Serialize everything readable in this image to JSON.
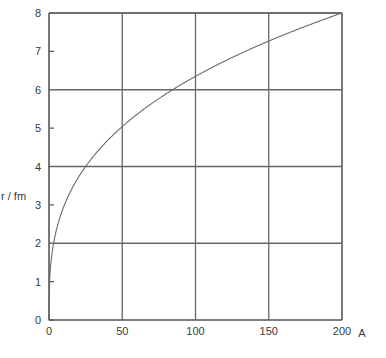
{
  "chart_data": {
    "type": "line",
    "title": "",
    "subtitle": "",
    "xlabel": "A",
    "ylabel": "r / fm",
    "xlim": [
      0,
      200
    ],
    "ylim": [
      0,
      8
    ],
    "grid": true,
    "grid_x_values": [
      50,
      100,
      150,
      200
    ],
    "grid_y_values": [
      2,
      4,
      6,
      8
    ],
    "legend": null,
    "legend_position": "none",
    "x_ticks": [
      {
        "value": 0,
        "label": "0",
        "gridline": false
      },
      {
        "value": 50,
        "label": "50",
        "gridline": true
      },
      {
        "value": 100,
        "label": "100",
        "gridline": true
      },
      {
        "value": 150,
        "label": "150",
        "gridline": true
      },
      {
        "value": 200,
        "label": "200",
        "gridline": true
      }
    ],
    "y_ticks": [
      {
        "value": 0,
        "label": "0",
        "gridline": false
      },
      {
        "value": 1,
        "label": "1",
        "gridline": false
      },
      {
        "value": 2,
        "label": "2",
        "gridline": true
      },
      {
        "value": 3,
        "label": "3",
        "gridline": false
      },
      {
        "value": 4,
        "label": "4",
        "gridline": true
      },
      {
        "value": 5,
        "label": "5",
        "gridline": false
      },
      {
        "value": 6,
        "label": "6",
        "gridline": true
      },
      {
        "value": 7,
        "label": "7",
        "gridline": false
      },
      {
        "value": 8,
        "label": "8",
        "gridline": true
      }
    ],
    "series": [
      {
        "name": "r = r0 * A^(1/3)",
        "color": "#6b6b6b",
        "r0": 1.368,
        "x": [
          0,
          0.5,
          1,
          2,
          3,
          4,
          5,
          6,
          8,
          10,
          12,
          15,
          18,
          20,
          25,
          30,
          35,
          40,
          45,
          50,
          60,
          70,
          80,
          90,
          100,
          110,
          120,
          130,
          140,
          150,
          160,
          170,
          180,
          190,
          200
        ],
        "values": [
          0,
          1.09,
          1.37,
          1.72,
          1.97,
          2.17,
          2.34,
          2.49,
          2.74,
          2.95,
          3.13,
          3.37,
          3.58,
          3.71,
          4.0,
          4.25,
          4.47,
          4.68,
          4.87,
          5.04,
          5.36,
          5.63,
          5.88,
          6.13,
          6.35,
          6.55,
          6.74,
          6.92,
          7.09,
          7.26,
          7.41,
          7.56,
          7.7,
          7.84,
          8.0
        ]
      }
    ],
    "annotations": []
  },
  "axes": {
    "y_axis_caption": "r / fm",
    "x_axis_caption": "A"
  },
  "colors": {
    "background": "#ffffff",
    "axis": "#555555",
    "grid": "#666666",
    "curve": "#6b6b6b",
    "text": "#3a3a3a"
  }
}
